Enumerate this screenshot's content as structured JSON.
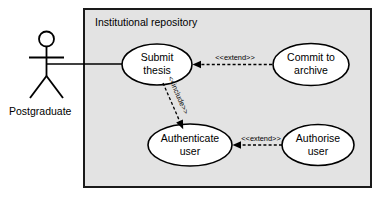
{
  "diagram": {
    "type": "uml-use-case-diagram",
    "boundary": {
      "title": "Institutional repository"
    },
    "actors": [
      {
        "id": "postgraduate",
        "label": "Postgraduate"
      }
    ],
    "use_cases": [
      {
        "id": "submit-thesis",
        "line1": "Submit",
        "line2": "thesis"
      },
      {
        "id": "commit-to-archive",
        "line1": "Commit to",
        "line2": "archive"
      },
      {
        "id": "authenticate-user",
        "line1": "Authenticate",
        "line2": "user"
      },
      {
        "id": "authorise-user",
        "line1": "Authorise",
        "line2": "user"
      }
    ],
    "associations": [
      {
        "id": "postgraduate-to-submit-thesis",
        "from": "postgraduate",
        "to": "submit-thesis",
        "style": "solid"
      }
    ],
    "relationships": [
      {
        "id": "extend-commit-to-submit",
        "label": "<<extend>>",
        "from": "commit-to-archive",
        "to": "submit-thesis",
        "style": "dashed-arrow"
      },
      {
        "id": "include-submit-to-authenticate",
        "label": "<<include>>",
        "from": "submit-thesis",
        "to": "authenticate-user",
        "style": "dashed-arrow"
      },
      {
        "id": "extend-authorise-to-authenticate",
        "label": "<<extend>>",
        "from": "authorise-user",
        "to": "authenticate-user",
        "style": "dashed-arrow"
      }
    ],
    "colors": {
      "boundary_fill": "#e3e3e3",
      "boundary_stroke": "#1a1a1a",
      "ellipse_fill": "#ffffff",
      "stroke": "#000000",
      "page_background": "#ffffff"
    }
  }
}
